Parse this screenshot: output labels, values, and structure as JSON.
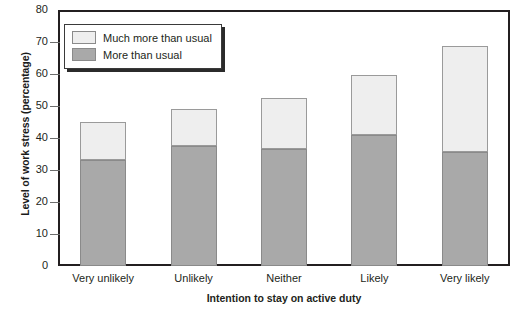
{
  "chart_data": {
    "type": "bar",
    "stacked": true,
    "title": "",
    "xlabel": "Intention to stay on active duty",
    "ylabel": "Level of work stress (percentage)",
    "categories": [
      "Very unlikely",
      "Unlikely",
      "Neither",
      "Likely",
      "Very likely"
    ],
    "series": [
      {
        "name": "More than usual",
        "color": "#a9a9a9",
        "values": [
          33.1,
          37.4,
          36.5,
          41.0,
          35.6
        ]
      },
      {
        "name": "Much more than usual",
        "color": "#eeeeee",
        "values": [
          11.9,
          11.8,
          16.0,
          18.7,
          33.1
        ]
      }
    ],
    "totals": [
      45.0,
      49.2,
      52.5,
      59.7,
      68.7
    ],
    "ylim": [
      0,
      80
    ],
    "yticks": [
      0,
      10,
      20,
      30,
      40,
      50,
      60,
      70,
      80
    ],
    "ytick_labels": [
      "0",
      "10",
      "20",
      "30",
      "40",
      "50",
      "60",
      "70",
      "80"
    ],
    "grid": false,
    "legend_position": "top-left",
    "legend_entries": [
      "Much more than usual",
      "More than usual"
    ]
  },
  "legend": {
    "entries": [
      {
        "label": "Much more than usual",
        "swatch": "light"
      },
      {
        "label": "More than usual",
        "swatch": "dark"
      }
    ]
  },
  "axes": {
    "y_title": "Level of work stress (percentage)",
    "x_title": "Intention to stay on active duty"
  }
}
